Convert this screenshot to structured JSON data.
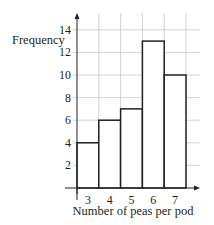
{
  "chart_data": {
    "type": "bar",
    "subtype": "histogram",
    "title": "",
    "xlabel": "Number of peas per pod",
    "ylabel": "Frequency",
    "categories": [
      "3",
      "4",
      "5",
      "6",
      "7"
    ],
    "values": [
      4,
      6,
      7,
      13,
      10
    ],
    "yticks": [
      2,
      4,
      6,
      8,
      10,
      12,
      14
    ],
    "ylim": [
      0,
      15
    ],
    "grid": true,
    "legend": null,
    "colors": {
      "bar_fill": "#ffffff",
      "bar_stroke": "#231f20",
      "grid": "#c8c8c8",
      "axis": "#231f20",
      "text": "#231f20"
    }
  }
}
